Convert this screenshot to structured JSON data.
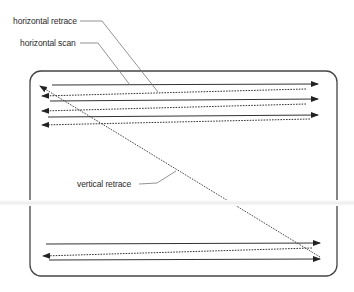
{
  "diagram": {
    "labels": {
      "horizontal_retrace": "horizontal retrace",
      "horizontal_scan": "horizontal scan",
      "vertical_retrace": "vertical retrace"
    },
    "colors": {
      "line": "#333333",
      "leader": "#777777",
      "frame": "#444444",
      "text": "#2a2a2a"
    },
    "frame": {
      "x": 30,
      "y": 71,
      "width": 307,
      "height": 205,
      "radius": 11
    },
    "scan_lines_top": [
      {
        "type": "scan",
        "x1": 52,
        "y1": 85,
        "x2": 318,
        "y2": 84
      },
      {
        "type": "retrace",
        "x1": 306,
        "y1": 89,
        "x2": 42,
        "y2": 96
      },
      {
        "type": "scan",
        "x1": 50,
        "y1": 101,
        "x2": 318,
        "y2": 99
      },
      {
        "type": "retrace",
        "x1": 306,
        "y1": 104,
        "x2": 42,
        "y2": 111
      },
      {
        "type": "scan",
        "x1": 48,
        "y1": 117,
        "x2": 318,
        "y2": 115
      },
      {
        "type": "retrace",
        "x1": 310,
        "y1": 119,
        "x2": 42,
        "y2": 125
      }
    ],
    "scan_lines_bottom": [
      {
        "type": "scan",
        "x1": 46,
        "y1": 244,
        "x2": 320,
        "y2": 243
      },
      {
        "type": "retrace",
        "x1": 312,
        "y1": 248,
        "x2": 43,
        "y2": 256
      },
      {
        "type": "scan",
        "x1": 49,
        "y1": 260,
        "x2": 320,
        "y2": 259
      }
    ],
    "vertical_retrace_line": {
      "x1": 320,
      "y1": 257,
      "x2": 40,
      "y2": 86
    }
  }
}
